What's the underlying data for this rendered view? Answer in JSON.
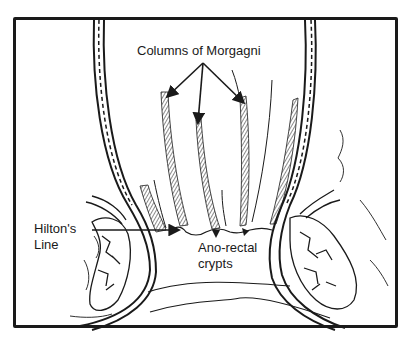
{
  "diagram": {
    "labels": {
      "columns": "Columns of Morgagni",
      "hilton_line1": "Hilton's",
      "hilton_line2": "Line",
      "crypts_line1": "Ano-rectal",
      "crypts_line2": "crypts"
    },
    "colors": {
      "ink": "#1a1a1a",
      "background": "#ffffff"
    }
  }
}
